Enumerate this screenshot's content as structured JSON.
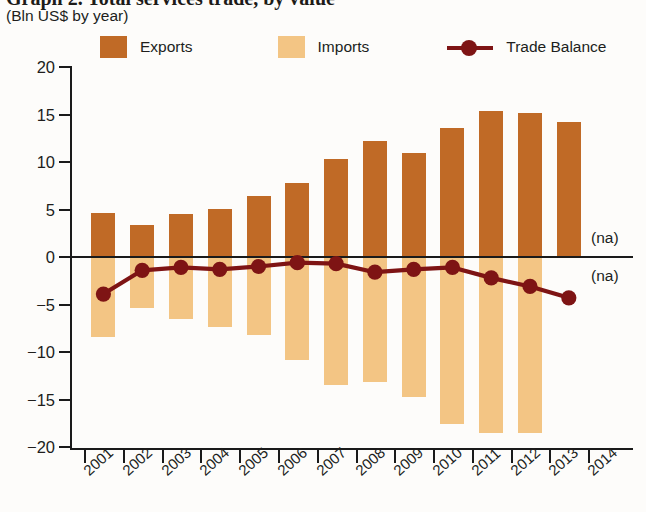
{
  "header": {
    "title": "Graph 2. Total services trade, by value",
    "subtitle": "(Bln US$ by year)"
  },
  "legend": {
    "position": "top",
    "items": [
      {
        "label": "Exports",
        "type": "swatch",
        "color": "#c06a26",
        "icon": "square-swatch"
      },
      {
        "label": "Imports",
        "type": "swatch",
        "color": "#f3c584",
        "icon": "square-swatch"
      },
      {
        "label": "Trade Balance",
        "type": "line-marker",
        "color": "#7e1414",
        "icon": "line-with-dot-marker"
      }
    ]
  },
  "annotations": {
    "na_upper": "(na)",
    "na_lower": "(na)"
  },
  "chart_data": {
    "type": "bar",
    "title": "Graph 2. Total services trade, by value",
    "subtitle": "(Bln US$ by year)",
    "xlabel": "",
    "ylabel": "",
    "ylim": [
      -20,
      20
    ],
    "yticks": [
      20,
      15,
      10,
      5,
      0,
      -5,
      -10,
      -15,
      -20
    ],
    "ytick_labels": [
      "20",
      "15",
      "10",
      "5",
      "0",
      "−5",
      "−10",
      "−15",
      "−20"
    ],
    "grid": false,
    "categories": [
      "2001",
      "2002",
      "2003",
      "2004",
      "2005",
      "2006",
      "2007",
      "2008",
      "2009",
      "2010",
      "2011",
      "2012",
      "2013",
      "2014"
    ],
    "series": [
      {
        "name": "Exports",
        "type": "bar",
        "color": "#c06a26",
        "values": [
          4.6,
          3.4,
          4.5,
          5.1,
          6.4,
          7.8,
          10.3,
          12.2,
          10.9,
          13.6,
          15.4,
          15.2,
          14.2,
          null
        ]
      },
      {
        "name": "Imports",
        "type": "bar",
        "color": "#f3c584",
        "values": [
          -8.4,
          -5.4,
          -6.5,
          -7.4,
          -8.2,
          -10.8,
          -13.5,
          -13.2,
          -14.7,
          -17.6,
          -18.5,
          -18.5,
          null,
          null
        ]
      },
      {
        "name": "Trade Balance",
        "type": "line",
        "color": "#7e1414",
        "values": [
          -3.9,
          -1.4,
          -1.1,
          -1.3,
          -1.0,
          -0.6,
          -0.7,
          -1.6,
          -1.3,
          -1.1,
          -2.2,
          -3.1,
          -4.3,
          null
        ]
      }
    ]
  }
}
